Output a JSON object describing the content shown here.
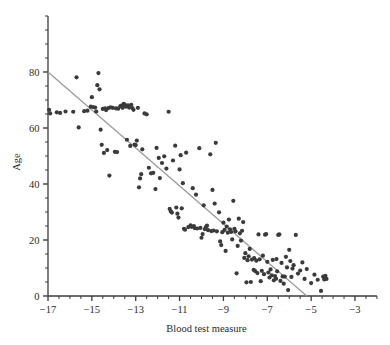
{
  "chart_data": {
    "type": "scatter",
    "title": "",
    "xlabel": "Blood test measure",
    "ylabel": "Age",
    "xlim": [
      -17.0,
      -2.0
    ],
    "ylim": [
      0,
      100
    ],
    "axis_visible_top_y": 100,
    "grid": false,
    "legend": null,
    "xticks_major": [
      -17,
      -15,
      -13,
      -11,
      -9,
      -7,
      -5,
      -3
    ],
    "xticks_major_labels": [
      "−17",
      "−15",
      "−13",
      "−11",
      "−9",
      "−7",
      "−5",
      "−3"
    ],
    "xtick_minor_step": 0.5,
    "yticks_major": [
      0,
      20,
      40,
      60,
      80
    ],
    "yticks_major_labels": [
      "0",
      "20",
      "40",
      "60",
      "80"
    ],
    "ytick_minor_step": 5,
    "point_color": "#3a3a3a",
    "point_radius": 2.1,
    "line_color": "#9a9a9a",
    "axis_color": "#3a3a3a",
    "trend_line": {
      "type": "line",
      "x_start": -17.0,
      "y_start": 80.0,
      "x_end": -5.2,
      "y_end": 0.0,
      "slope": -6.78,
      "intercept": -35.3
    },
    "n_points": 186,
    "points": [
      [
        -16.95,
        66.5
      ],
      [
        -16.9,
        65.2
      ],
      [
        -16.6,
        65.6
      ],
      [
        -16.45,
        65.4
      ],
      [
        -16.2,
        65.9
      ],
      [
        -15.85,
        65.8
      ],
      [
        -15.7,
        78.1
      ],
      [
        -15.6,
        60.2
      ],
      [
        -15.35,
        66.0
      ],
      [
        -15.2,
        66.2
      ],
      [
        -15.05,
        67.6
      ],
      [
        -15.0,
        71.0
      ],
      [
        -14.95,
        67.5
      ],
      [
        -14.85,
        67.3
      ],
      [
        -14.8,
        65.9
      ],
      [
        -14.75,
        75.3
      ],
      [
        -14.7,
        79.6
      ],
      [
        -14.65,
        73.8
      ],
      [
        -14.6,
        59.4
      ],
      [
        -14.55,
        54.0
      ],
      [
        -14.5,
        66.8
      ],
      [
        -14.45,
        51.1
      ],
      [
        -14.4,
        67.0
      ],
      [
        -14.35,
        66.4
      ],
      [
        -14.3,
        52.1
      ],
      [
        -14.25,
        67.1
      ],
      [
        -14.2,
        43.0
      ],
      [
        -14.15,
        67.4
      ],
      [
        -14.05,
        67.2
      ],
      [
        -13.95,
        51.5
      ],
      [
        -13.9,
        67.0
      ],
      [
        -13.85,
        51.4
      ],
      [
        -13.8,
        66.9
      ],
      [
        -13.7,
        67.8
      ],
      [
        -13.65,
        68.0
      ],
      [
        -13.6,
        67.2
      ],
      [
        -13.5,
        68.4
      ],
      [
        -13.45,
        67.6
      ],
      [
        -13.4,
        55.8
      ],
      [
        -13.35,
        68.1
      ],
      [
        -13.3,
        67.3
      ],
      [
        -13.25,
        53.6
      ],
      [
        -13.2,
        68.3
      ],
      [
        -13.15,
        67.1
      ],
      [
        -13.1,
        66.5
      ],
      [
        -13.05,
        54.1
      ],
      [
        -13.0,
        53.9
      ],
      [
        -12.95,
        55.5
      ],
      [
        -12.9,
        67.2
      ],
      [
        -12.85,
        38.8
      ],
      [
        -12.8,
        42.0
      ],
      [
        -12.75,
        43.5
      ],
      [
        -12.7,
        52.4
      ],
      [
        -12.6,
        65.2
      ],
      [
        -12.5,
        64.9
      ],
      [
        -12.4,
        45.8
      ],
      [
        -12.3,
        43.8
      ],
      [
        -12.2,
        44.0
      ],
      [
        -12.1,
        38.2
      ],
      [
        -11.95,
        49.3
      ],
      [
        -11.9,
        42.1
      ],
      [
        -11.8,
        47.5
      ],
      [
        -11.7,
        49.9
      ],
      [
        -11.6,
        45.5
      ],
      [
        -11.5,
        65.8
      ],
      [
        -11.45,
        31.1
      ],
      [
        -11.4,
        30.2
      ],
      [
        -11.35,
        29.8
      ],
      [
        -11.3,
        48.4
      ],
      [
        -11.2,
        53.7
      ],
      [
        -11.15,
        31.6
      ],
      [
        -11.1,
        29.4
      ],
      [
        -11.05,
        28.0
      ],
      [
        -11.0,
        45.2
      ],
      [
        -10.95,
        50.3
      ],
      [
        -10.9,
        31.3
      ],
      [
        -10.85,
        40.3
      ],
      [
        -10.8,
        24.0
      ],
      [
        -10.75,
        23.7
      ],
      [
        -10.7,
        51.2
      ],
      [
        -10.6,
        24.6
      ],
      [
        -10.5,
        25.2
      ],
      [
        -10.45,
        24.7
      ],
      [
        -10.4,
        38.5
      ],
      [
        -10.35,
        25.0
      ],
      [
        -10.3,
        24.2
      ],
      [
        -10.25,
        36.2
      ],
      [
        -10.2,
        24.1
      ],
      [
        -10.1,
        52.8
      ],
      [
        -10.05,
        24.3
      ],
      [
        -10.0,
        20.8
      ],
      [
        -9.95,
        22.1
      ],
      [
        -9.9,
        32.4
      ],
      [
        -9.85,
        23.9
      ],
      [
        -9.8,
        24.6
      ],
      [
        -9.75,
        25.1
      ],
      [
        -9.7,
        23.5
      ],
      [
        -9.6,
        50.6
      ],
      [
        -9.55,
        23.2
      ],
      [
        -9.5,
        37.9
      ],
      [
        -9.45,
        23.4
      ],
      [
        -9.4,
        33.0
      ],
      [
        -9.35,
        54.7
      ],
      [
        -9.3,
        23.1
      ],
      [
        -9.2,
        29.9
      ],
      [
        -9.15,
        19.5
      ],
      [
        -9.1,
        18.2
      ],
      [
        -9.0,
        26.2
      ],
      [
        -8.95,
        23.6
      ],
      [
        -8.9,
        16.1
      ],
      [
        -8.85,
        24.8
      ],
      [
        -8.8,
        22.6
      ],
      [
        -8.75,
        27.3
      ],
      [
        -8.7,
        23.8
      ],
      [
        -8.65,
        22.9
      ],
      [
        -8.6,
        20.2
      ],
      [
        -8.55,
        34.0
      ],
      [
        -8.5,
        24.0
      ],
      [
        -8.45,
        23.1
      ],
      [
        -8.4,
        8.1
      ],
      [
        -8.35,
        17.9
      ],
      [
        -8.3,
        27.6
      ],
      [
        -8.25,
        22.4
      ],
      [
        -8.2,
        19.8
      ],
      [
        -8.1,
        26.4
      ],
      [
        -8.05,
        13.6
      ],
      [
        -8.0,
        15.3
      ],
      [
        -7.95,
        4.9
      ],
      [
        -7.9,
        12.8
      ],
      [
        -7.85,
        14.2
      ],
      [
        -7.8,
        16.8
      ],
      [
        -7.75,
        5.0
      ],
      [
        -7.7,
        13.0
      ],
      [
        -7.6,
        13.5
      ],
      [
        -7.55,
        8.9
      ],
      [
        -7.5,
        12.6
      ],
      [
        -7.45,
        8.2
      ],
      [
        -7.4,
        22.0
      ],
      [
        -7.35,
        13.1
      ],
      [
        -7.3,
        5.3
      ],
      [
        -7.25,
        9.0
      ],
      [
        -7.2,
        14.4
      ],
      [
        -7.15,
        7.8
      ],
      [
        -7.1,
        21.9
      ],
      [
        -7.05,
        22.1
      ],
      [
        -7.0,
        12.2
      ],
      [
        -6.95,
        8.4
      ],
      [
        -6.9,
        6.6
      ],
      [
        -6.85,
        9.5
      ],
      [
        -6.8,
        7.4
      ],
      [
        -6.75,
        12.9
      ],
      [
        -6.7,
        5.6
      ],
      [
        -6.65,
        7.1
      ],
      [
        -6.6,
        6.2
      ],
      [
        -6.55,
        8.8
      ],
      [
        -6.5,
        21.8
      ],
      [
        -6.45,
        22.0
      ],
      [
        -6.4,
        5.4
      ],
      [
        -6.35,
        11.8
      ],
      [
        -6.3,
        7.0
      ],
      [
        -6.25,
        4.4
      ],
      [
        -6.2,
        6.9
      ],
      [
        -6.15,
        14.0
      ],
      [
        -6.1,
        10.2
      ],
      [
        -6.05,
        2.1
      ],
      [
        -6.0,
        16.5
      ],
      [
        -5.95,
        12.5
      ],
      [
        -5.9,
        6.8
      ],
      [
        -5.85,
        9.8
      ],
      [
        -5.8,
        11.0
      ],
      [
        -5.7,
        21.8
      ],
      [
        -5.6,
        8.0
      ],
      [
        -5.5,
        9.1
      ],
      [
        -5.4,
        12.0
      ],
      [
        -5.3,
        6.1
      ],
      [
        -5.2,
        9.6
      ],
      [
        -5.0,
        4.6
      ],
      [
        -4.85,
        7.6
      ],
      [
        -4.7,
        5.8
      ],
      [
        -4.55,
        1.8
      ],
      [
        -4.45,
        6.9
      ],
      [
        -4.4,
        5.9
      ],
      [
        -4.35,
        7.2
      ],
      [
        -4.3,
        6.1
      ],
      [
        -13.55,
        68.6
      ],
      [
        -12.05,
        52.9
      ],
      [
        -9.05,
        22.8
      ],
      [
        -8.15,
        23.3
      ],
      [
        -7.62,
        9.3
      ],
      [
        -6.58,
        13.2
      ]
    ]
  }
}
